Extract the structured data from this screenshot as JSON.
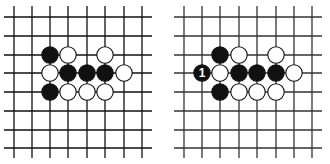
{
  "boards": [
    {
      "id": "left",
      "offset_x": 0,
      "line_color": "#111111",
      "xs": [
        14,
        32,
        50,
        68,
        87,
        105,
        124,
        142
      ],
      "ys": [
        17,
        36,
        55,
        73,
        92,
        111,
        130,
        148
      ],
      "x_extent": [
        4,
        152
      ],
      "y_extent": [
        6,
        158
      ],
      "stones": [
        {
          "col": 2,
          "row": 2,
          "color": "black"
        },
        {
          "col": 3,
          "row": 2,
          "color": "white"
        },
        {
          "col": 5,
          "row": 2,
          "color": "white"
        },
        {
          "col": 2,
          "row": 3,
          "color": "white"
        },
        {
          "col": 3,
          "row": 3,
          "color": "black"
        },
        {
          "col": 4,
          "row": 3,
          "color": "black"
        },
        {
          "col": 5,
          "row": 3,
          "color": "black"
        },
        {
          "col": 6,
          "row": 3,
          "color": "white"
        },
        {
          "col": 2,
          "row": 4,
          "color": "black"
        },
        {
          "col": 3,
          "row": 4,
          "color": "white"
        },
        {
          "col": 4,
          "row": 4,
          "color": "white"
        },
        {
          "col": 5,
          "row": 4,
          "color": "white"
        }
      ]
    },
    {
      "id": "right",
      "offset_x": 0,
      "line_color": "#333333",
      "xs": [
        184,
        202,
        220,
        239,
        257,
        276,
        294,
        312
      ],
      "ys": [
        17,
        36,
        55,
        73,
        92,
        111,
        130,
        148
      ],
      "x_extent": [
        174,
        322
      ],
      "y_extent": [
        6,
        158
      ],
      "stones": [
        {
          "col": 2,
          "row": 2,
          "color": "black"
        },
        {
          "col": 3,
          "row": 2,
          "color": "white"
        },
        {
          "col": 5,
          "row": 2,
          "color": "white"
        },
        {
          "col": 1,
          "row": 3,
          "color": "black",
          "label": "1"
        },
        {
          "col": 2,
          "row": 3,
          "color": "white"
        },
        {
          "col": 3,
          "row": 3,
          "color": "black"
        },
        {
          "col": 4,
          "row": 3,
          "color": "black"
        },
        {
          "col": 5,
          "row": 3,
          "color": "black"
        },
        {
          "col": 6,
          "row": 3,
          "color": "white"
        },
        {
          "col": 2,
          "row": 4,
          "color": "black"
        },
        {
          "col": 3,
          "row": 4,
          "color": "white"
        },
        {
          "col": 4,
          "row": 4,
          "color": "white"
        },
        {
          "col": 5,
          "row": 4,
          "color": "white"
        }
      ]
    }
  ],
  "stone_radius": 8.2,
  "colors": {
    "black_stone": "#111111",
    "white_stone": "#ffffff",
    "stone_outline": "#111111",
    "label_on_black": "#ffffff"
  }
}
